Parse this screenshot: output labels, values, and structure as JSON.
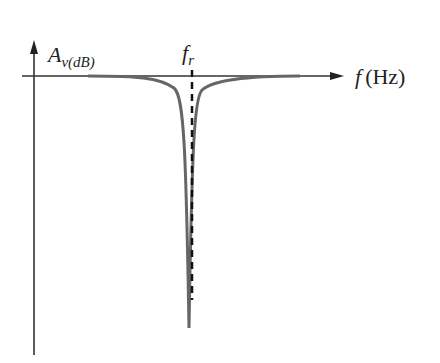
{
  "diagram": {
    "type": "notch-filter-frequency-response",
    "y_axis": {
      "symbol": "A",
      "subscript": "v(dB)"
    },
    "x_axis": {
      "symbol": "f",
      "unit": "(Hz)"
    },
    "marker": {
      "symbol": "f",
      "subscript": "r"
    },
    "colors": {
      "axis": "#333333",
      "curve": "#666666",
      "dashed": "#111111",
      "background": "#ffffff"
    }
  }
}
